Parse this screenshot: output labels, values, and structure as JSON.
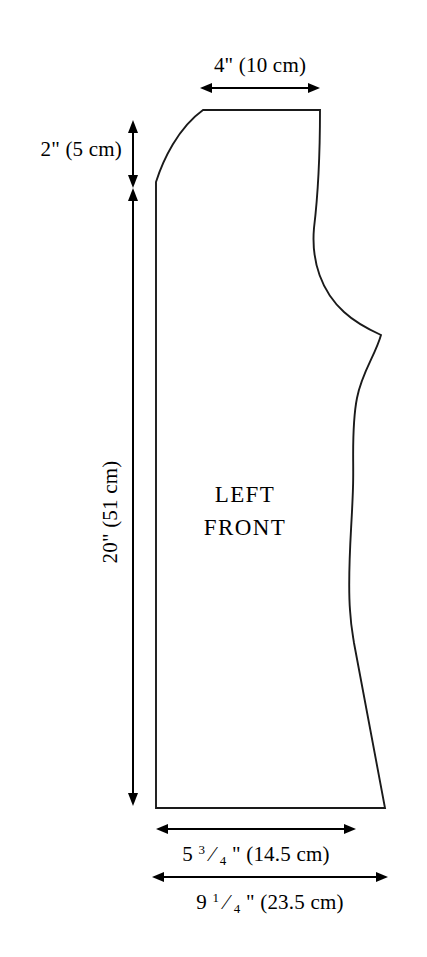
{
  "figure": {
    "background_color": "#ffffff",
    "line_color": "#1a1a1a",
    "piece_label_line1": "LEFT",
    "piece_label_line2": "FRONT"
  },
  "dimensions": {
    "shoulder_top": {
      "label": "4\" (10 cm)",
      "inches": "4",
      "centimeters": "10",
      "orientation": "horizontal",
      "position": "above-top-edge"
    },
    "neck_drop": {
      "label": "2\" (5 cm)",
      "inches": "2",
      "centimeters": "5",
      "orientation": "vertical",
      "position": "left-of-piece-upper"
    },
    "center_front_length": {
      "label": "20\" (51 cm)",
      "inches": "20",
      "centimeters": "51",
      "orientation": "vertical-rotated",
      "position": "left-of-piece"
    },
    "waist_width": {
      "inches_whole": "5",
      "frac_numerator": "3",
      "frac_denominator": "4",
      "suffix": "\" (14.5 cm)",
      "label": "5 3/4\" (14.5 cm)",
      "centimeters": "14.5",
      "orientation": "horizontal",
      "position": "below-hem-upper"
    },
    "hem_width": {
      "inches_whole": "9",
      "frac_numerator": "1",
      "frac_denominator": "4",
      "suffix": "\" (23.5 cm)",
      "label": "9 1/4\" (23.5 cm)",
      "centimeters": "23.5",
      "orientation": "horizontal",
      "position": "below-hem-lower"
    }
  }
}
